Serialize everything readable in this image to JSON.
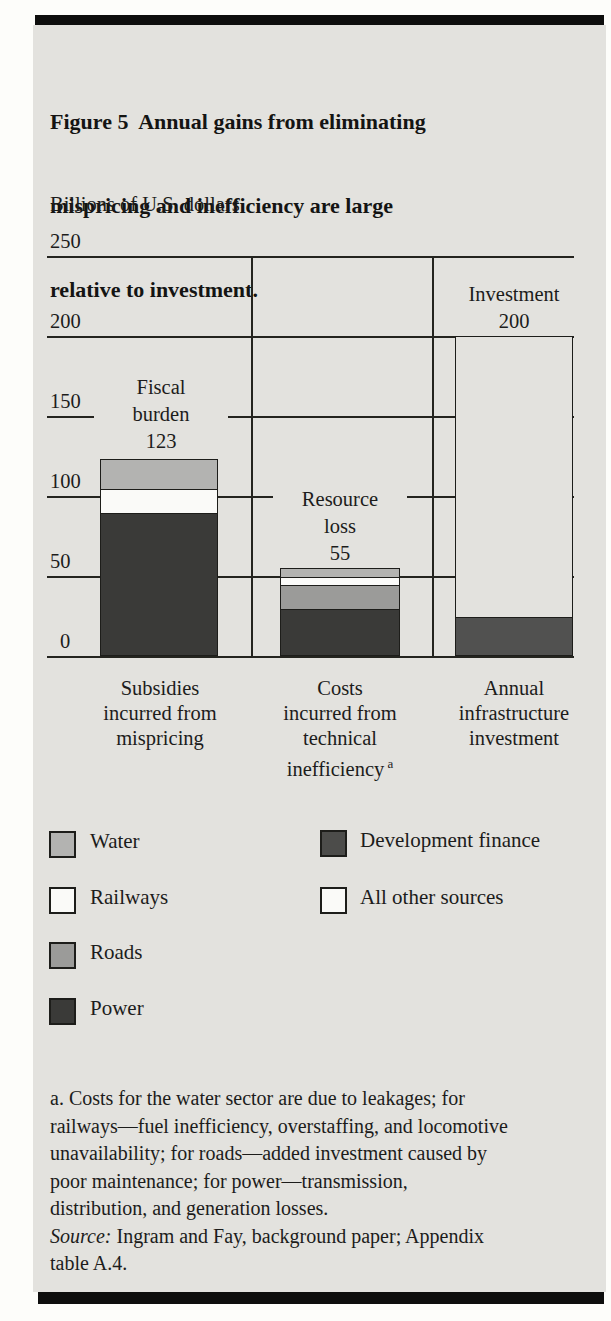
{
  "figure": {
    "title_lines": [
      "Figure 5  Annual gains from eliminating",
      "mispricing and inefficiency are large",
      "relative to investment."
    ],
    "unit_label": "Billions of U.S. dollars"
  },
  "chart_data": {
    "type": "bar",
    "stacked": true,
    "title": "Figure 5  Annual gains from eliminating mispricing and inefficiency are large relative to investment.",
    "ylabel": "Billions of U.S. dollars",
    "ylim": [
      0,
      250
    ],
    "yticks": [
      250,
      200,
      150,
      100,
      50,
      0
    ],
    "grid": "horizontal gridlines at every ytick; vertical separator lines between the three categories",
    "legend_position": "below chart, two columns",
    "categories": [
      "Subsidies incurred from mispricing",
      "Costs incurred from technical inefficiency",
      "Annual infrastructure investment"
    ],
    "bars": [
      {
        "category_lines": [
          "Subsidies",
          "incurred from",
          "mispricing"
        ],
        "annotation_lines": [
          "Fiscal",
          "burden",
          "123"
        ],
        "total": 123,
        "segments": [
          {
            "name": "Power",
            "value": 90
          },
          {
            "name": "Railways",
            "value": 15
          },
          {
            "name": "Water",
            "value": 18
          }
        ]
      },
      {
        "category_lines": [
          "Costs",
          "incurred from",
          "technical",
          "inefficiency"
        ],
        "category_sup": "a",
        "annotation_lines": [
          "Resource",
          "loss",
          "55"
        ],
        "total": 55,
        "segments": [
          {
            "name": "Power",
            "value": 30
          },
          {
            "name": "Roads",
            "value": 15
          },
          {
            "name": "Railways",
            "value": 5
          },
          {
            "name": "Water",
            "value": 5
          }
        ]
      },
      {
        "category_lines": [
          "Annual",
          "infrastructure",
          "investment"
        ],
        "annotation_lines": [
          "Investment",
          "200"
        ],
        "total": 200,
        "segments": [
          {
            "name": "Development finance",
            "value": 25
          },
          {
            "name": "All other sources",
            "value": 175
          }
        ]
      }
    ]
  },
  "legend": {
    "left_column": [
      {
        "label": "Water",
        "swatch": "#b3b3b1"
      },
      {
        "label": "Railways",
        "swatch": "#fafaf8"
      },
      {
        "label": "Roads",
        "swatch": "#9b9b99"
      },
      {
        "label": "Power",
        "swatch": "#3a3a38"
      }
    ],
    "right_column": [
      {
        "label": "Development finance",
        "swatch": "#4c4c4a"
      },
      {
        "label": "All other sources",
        "swatch": "#fafaf8"
      }
    ]
  },
  "footnote": {
    "lines": [
      "a. Costs for the water sector are due to leakages; for",
      "railways—fuel inefficiency, overstaffing, and locomotive",
      "unavailability; for roads—added investment caused by",
      "poor maintenance; for power—transmission,",
      "distribution, and generation losses."
    ],
    "source_label": "Source:",
    "source_line1": " Ingram and Fay, background paper; Appendix",
    "source_line2": "table A.4."
  },
  "colors": {
    "panel_background": "#e3e2de",
    "line": "#24241f",
    "Power": "#3a3a38",
    "Roads": "#9b9b99",
    "Railways": "#fafaf8",
    "Water": "#b3b3b1",
    "Development finance": "#515150",
    "All other sources": "#e3e2de",
    "all_other_sources_legend_swatch": "#fafaf8"
  }
}
